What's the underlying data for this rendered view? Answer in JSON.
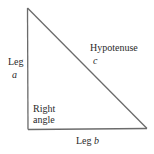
{
  "diagram": {
    "vertices": {
      "top": [
        27,
        8
      ],
      "bottom_left": [
        28,
        129
      ],
      "bottom_right": [
        147,
        128
      ]
    },
    "stroke_color": "#6b6b6b",
    "labels": {
      "leg_a_word": "Leg",
      "leg_a_var": "a",
      "hypotenuse_word": "Hypotenuse",
      "hypotenuse_var": "c",
      "right_angle_line1": "Right",
      "right_angle_line2": "angle",
      "leg_b_word": "Leg",
      "leg_b_var": "b"
    }
  }
}
